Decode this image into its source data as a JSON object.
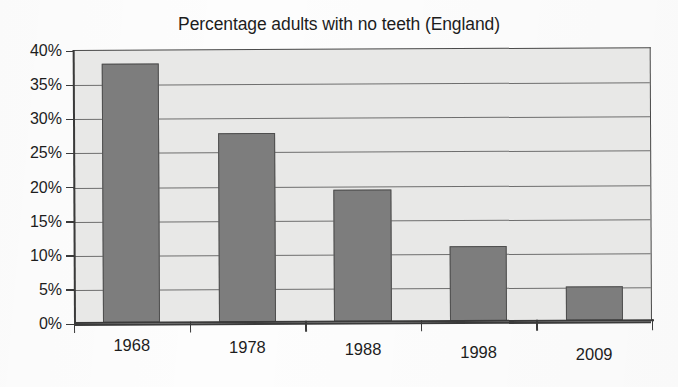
{
  "chart_data": {
    "type": "bar",
    "title": "Percentage adults with no teeth (England)",
    "xlabel": "",
    "ylabel": "",
    "categories": [
      "1968",
      "1978",
      "1988",
      "1998",
      "2009"
    ],
    "values": [
      38,
      27.7,
      19.4,
      11,
      5
    ],
    "values_display": [
      "38%",
      "27.7%",
      "19.4%",
      "11%",
      "5%"
    ],
    "ylim": [
      0,
      40
    ],
    "ytick_step": 5,
    "ytick_labels": [
      "40%",
      "35%",
      "30%",
      "25%",
      "20%",
      "15%",
      "10%",
      "5%",
      "0%"
    ],
    "ytick_values": [
      40,
      35,
      30,
      25,
      20,
      15,
      10,
      5,
      0
    ],
    "grid": true,
    "grid_axis": "y",
    "legend": false,
    "legend_position": "none",
    "series": [
      {
        "name": "Percentage adults with no teeth",
        "values": [
          38,
          27.7,
          19.4,
          11,
          5
        ]
      }
    ],
    "colors": {
      "bar_fill": "#7d7d7d",
      "bar_border": "#4e4e4e",
      "plot_background": "#e8e8e7",
      "gridline": "#6e6e6e",
      "axis": "#3a3a3a",
      "text": "#1d1d1d",
      "figure_background": "#fdfdfd"
    }
  }
}
